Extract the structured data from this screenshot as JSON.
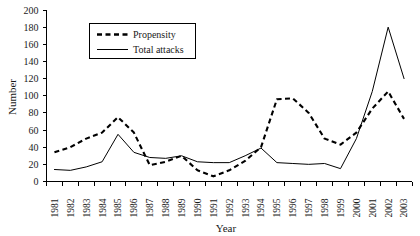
{
  "chart_data": {
    "type": "line",
    "title": "",
    "xlabel": "Year",
    "ylabel": "Number",
    "ylim": [
      0,
      200
    ],
    "ytick_step": 20,
    "yticks": [
      0,
      20,
      40,
      60,
      80,
      100,
      120,
      140,
      160,
      180,
      200
    ],
    "grid": false,
    "legend_position": "top-left-inside",
    "categories": [
      "1981",
      "1982",
      "1983",
      "1984",
      "1985",
      "1986",
      "1987",
      "1988",
      "1989",
      "1990",
      "1991",
      "1992",
      "1993",
      "1994",
      "1995",
      "1996",
      "1997",
      "1998",
      "1999",
      "2000",
      "2001",
      "2002",
      "2003"
    ],
    "series": [
      {
        "name": "Propensity",
        "style": "dashed",
        "values": [
          34,
          40,
          50,
          57,
          75,
          57,
          19,
          23,
          30,
          13,
          6,
          13,
          24,
          40,
          96,
          97,
          80,
          50,
          43,
          57,
          85,
          105,
          73
        ]
      },
      {
        "name": "Total attacks",
        "style": "solid",
        "values": [
          14,
          13,
          17,
          23,
          55,
          34,
          28,
          27,
          30,
          23,
          22,
          22,
          30,
          39,
          22,
          21,
          20,
          21,
          15,
          50,
          105,
          180,
          120
        ]
      }
    ]
  },
  "axes": {
    "y_label": "Number",
    "x_label": "Year"
  },
  "legend": {
    "items": [
      {
        "label": "Propensity",
        "style": "dashed"
      },
      {
        "label": "Total attacks",
        "style": "solid"
      }
    ]
  }
}
